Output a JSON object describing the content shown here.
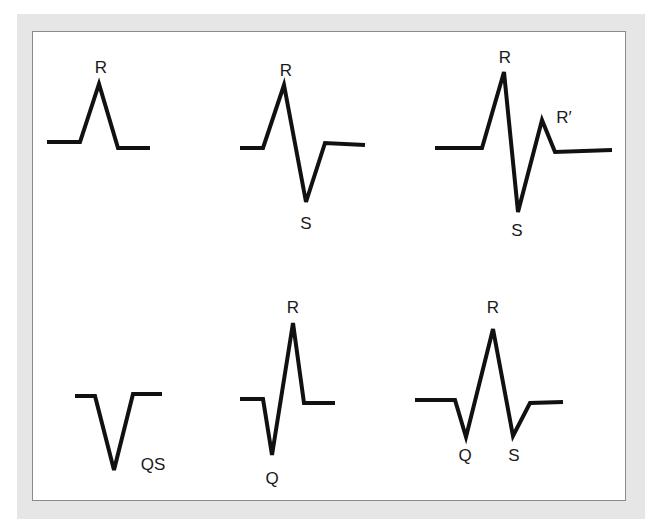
{
  "figure": {
    "colors": {
      "frame": "#e6e6e6",
      "border": "#8a8a8a",
      "line": "#111111",
      "text": "#1a1a1a"
    },
    "waveforms": [
      {
        "id": "r",
        "points": "47,142 80,142 99,84 118,148 150,148",
        "labels": [
          {
            "text": "R",
            "x": 101,
            "y": 73
          }
        ]
      },
      {
        "id": "rs",
        "points": "240,148 263,148 284,85 306,202 325,143 365,145",
        "labels": [
          {
            "text": "R",
            "x": 286,
            "y": 76
          },
          {
            "text": "S",
            "x": 306,
            "y": 229
          }
        ]
      },
      {
        "id": "rsr-prime",
        "points": "435,148 482,148 504,72 518,212 542,120 555,152 612,150",
        "labels": [
          {
            "text": "R",
            "x": 505,
            "y": 63
          },
          {
            "text": "R′",
            "x": 564,
            "y": 123
          },
          {
            "text": "S",
            "x": 517,
            "y": 236
          }
        ]
      },
      {
        "id": "qs",
        "points": "75,396 95,396 114,470 133,394 162,394",
        "labels": [
          {
            "text": "QS",
            "x": 153,
            "y": 470
          }
        ]
      },
      {
        "id": "qr",
        "points": "240,399 263,399 272,455 293,323 304,403 335,403",
        "labels": [
          {
            "text": "R",
            "x": 293,
            "y": 313
          },
          {
            "text": "Q",
            "x": 272,
            "y": 484
          }
        ]
      },
      {
        "id": "qrs",
        "points": "415,400 455,400 466,437 493,329 513,436 530,403 563,402",
        "labels": [
          {
            "text": "R",
            "x": 493,
            "y": 313
          },
          {
            "text": "Q",
            "x": 465,
            "y": 461
          },
          {
            "text": "S",
            "x": 514,
            "y": 461
          }
        ]
      }
    ]
  }
}
